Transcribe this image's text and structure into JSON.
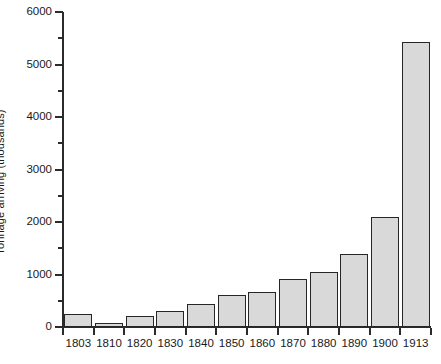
{
  "chart_data": {
    "type": "bar",
    "title": "",
    "xlabel": "",
    "ylabel": "Tonnage arriving (thousands)",
    "categories": [
      "1803",
      "1810",
      "1820",
      "1830",
      "1840",
      "1850",
      "1860",
      "1870",
      "1880",
      "1890",
      "1900",
      "1913"
    ],
    "values": [
      250,
      80,
      210,
      300,
      440,
      610,
      670,
      920,
      1040,
      1390,
      2100,
      5420
    ],
    "ylim": [
      0,
      6000
    ],
    "ytick_labels": [
      "0",
      "1000",
      "2000",
      "3000",
      "4000",
      "5000",
      "6000"
    ],
    "ytick_values": [
      0,
      1000,
      2000,
      3000,
      4000,
      5000,
      6000
    ],
    "yminor_values": [
      500,
      1500,
      2500,
      3500,
      4500,
      5500
    ],
    "grid": "off",
    "legend": "none",
    "bar_fill_color": "#d9d9d9",
    "bar_edge_color": "#262626",
    "axis_color": "#2b2b2b",
    "background_color": "#ffffff"
  }
}
